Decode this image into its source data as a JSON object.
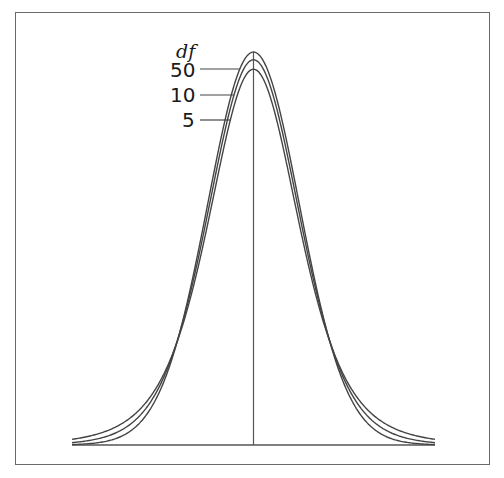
{
  "chart_data": {
    "type": "line",
    "title": "",
    "xlabel": "",
    "ylabel": "",
    "legend_title": "df",
    "legend_position": "upper-left of peak, labels with leader lines",
    "grid": false,
    "xlim": [
      -3.9,
      3.9
    ],
    "ylim": [
      0,
      0.4
    ],
    "center_line": 0,
    "series": [
      {
        "name": "50",
        "df": 50,
        "peak_density": 0.397
      },
      {
        "name": "10",
        "df": 10,
        "peak_density": 0.389
      },
      {
        "name": "5",
        "df": 5,
        "peak_density": 0.38
      }
    ]
  },
  "legend": {
    "title": "df",
    "labels": [
      "50",
      "10",
      "5"
    ]
  },
  "colors": {
    "curve": "#444444",
    "frame": "#6a6a6a",
    "background": "#ffffff"
  }
}
